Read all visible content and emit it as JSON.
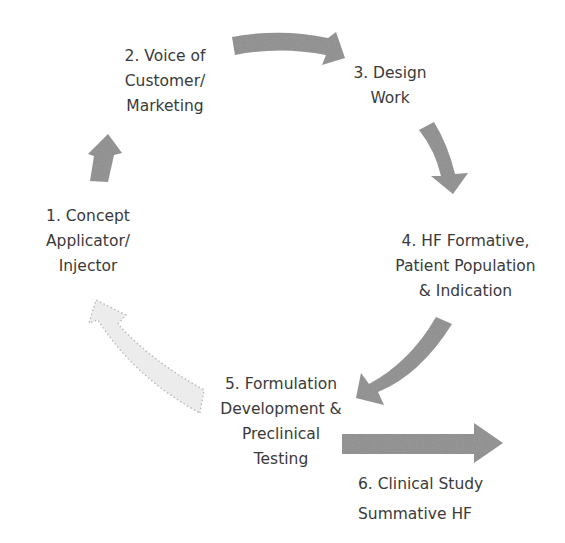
{
  "diagram": {
    "type": "cycle",
    "arrow_color": "#8e8e8e",
    "faded_arrow_color": "#e2e2e2",
    "text_color": "#3a3a3a",
    "steps": [
      {
        "id": 1,
        "lines": [
          "1. Concept",
          "Applicator/",
          "Injector"
        ]
      },
      {
        "id": 2,
        "lines": [
          "2. Voice of",
          "Customer/",
          "Marketing"
        ]
      },
      {
        "id": 3,
        "lines": [
          "3. Design",
          "Work"
        ]
      },
      {
        "id": 4,
        "lines": [
          "4. HF Formative,",
          "Patient Population",
          "& Indication"
        ]
      },
      {
        "id": 5,
        "lines": [
          "5. Formulation",
          "Development &",
          "Preclinical",
          "Testing"
        ]
      },
      {
        "id": 6,
        "lines": [
          "6. Clinical Study",
          "Summative HF"
        ]
      }
    ],
    "arrows": [
      {
        "from": 1,
        "to": 2,
        "style": "solid"
      },
      {
        "from": 2,
        "to": 3,
        "style": "solid"
      },
      {
        "from": 3,
        "to": 4,
        "style": "solid"
      },
      {
        "from": 4,
        "to": 5,
        "style": "solid"
      },
      {
        "from": 5,
        "to": 1,
        "style": "dotted-faded"
      },
      {
        "from": 5,
        "to": 6,
        "style": "solid-straight"
      }
    ]
  }
}
